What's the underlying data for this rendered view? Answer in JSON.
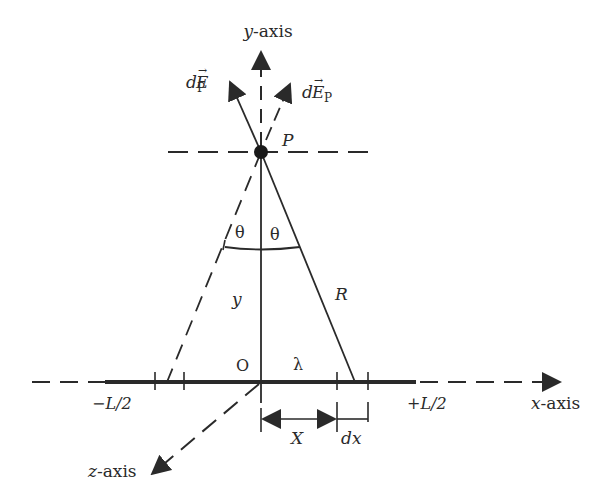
{
  "diagram": {
    "labels": {
      "y_axis": "y-axis",
      "x_axis": "x-axis",
      "z_axis": "z-axis",
      "field_left": "dE",
      "field_left_sub": "P",
      "field_right": "dE",
      "field_right_sub": "P",
      "point": "P",
      "theta_left": "θ",
      "theta_right": "θ",
      "distance_y": "y",
      "distance_R": "R",
      "origin": "O",
      "charge_density": "λ",
      "left_end": "−L/2",
      "right_end": "+L/2",
      "position_X": "X",
      "element_dx": "dx"
    },
    "colors": {
      "line": "#2a2a2a",
      "background": "#ffffff"
    }
  }
}
